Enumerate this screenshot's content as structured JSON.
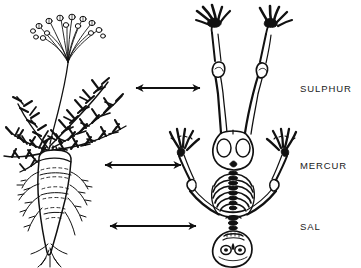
{
  "figure": {
    "kind": "alchemical-correspondence-diagram",
    "background_color": "#ffffff",
    "ink_color": "#111111",
    "width": 361,
    "height": 268
  },
  "labels": [
    {
      "id": "sulphur",
      "text": "SULPHUR",
      "x": 300,
      "y": 84
    },
    {
      "id": "mercur",
      "text": "MERCUR",
      "x": 300,
      "y": 161
    },
    {
      "id": "sal",
      "text": "SAL",
      "x": 300,
      "y": 222
    }
  ],
  "arrows": [
    {
      "id": "arrow-sulphur",
      "x1": 136,
      "x2": 200,
      "y": 88,
      "double_headed": true
    },
    {
      "id": "arrow-mercur",
      "x1": 105,
      "x2": 181,
      "y": 165,
      "double_headed": true
    },
    {
      "id": "arrow-bottom",
      "x1": 110,
      "x2": 196,
      "y": 226,
      "double_headed": true
    }
  ],
  "left_figure": {
    "name": "carrot-plant",
    "parts": [
      "flower-umbel",
      "stem",
      "foliage",
      "taproot",
      "rootlets"
    ]
  },
  "right_figure": {
    "name": "human-skeleton-inverted",
    "parts": [
      "legs",
      "feet",
      "pelvis",
      "spine",
      "ribcage",
      "arms",
      "hands",
      "skull"
    ]
  }
}
